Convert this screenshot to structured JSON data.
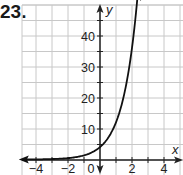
{
  "problem": {
    "number": "23."
  },
  "chart_data": {
    "type": "line",
    "title": "",
    "xlabel": "x",
    "ylabel": "y",
    "xlim": [
      -5,
      5
    ],
    "ylim": [
      -2,
      50
    ],
    "grid": true,
    "x_ticks": [
      -4,
      -2,
      0,
      2,
      4
    ],
    "x_tick_labels": [
      "−4",
      "−2",
      "0",
      "2",
      "4"
    ],
    "y_ticks": [
      10,
      20,
      30,
      40
    ],
    "y_tick_labels": [
      "10",
      "20",
      "30",
      "40"
    ],
    "series": [
      {
        "name": "exponential curve",
        "x": [
          -5,
          -4,
          -3,
          -2,
          -1,
          0,
          0.5,
          1,
          1.5,
          2,
          2.3
        ],
        "values": [
          0.02,
          0.05,
          0.15,
          0.44,
          1.3,
          4,
          6.9,
          12,
          20.8,
          36,
          50
        ]
      }
    ],
    "annotations": [
      "arrow at left end of curve",
      "arrow at top end of curve"
    ],
    "colors": {
      "grid": "#c8c8c8",
      "axis": "#222222",
      "curve": "#111111"
    }
  }
}
